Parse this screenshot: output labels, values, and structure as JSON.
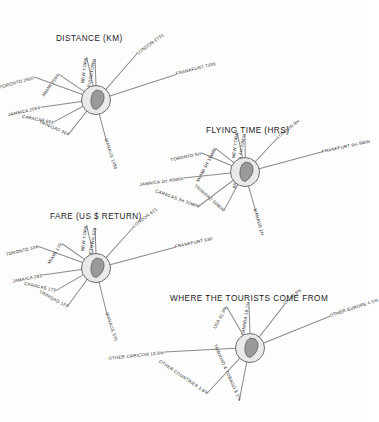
{
  "page": {
    "background": "#fdfdfd",
    "ink": "#1b1b1b",
    "hub_fill": "#e9e9e9",
    "hub_stroke": "#6d6d6d",
    "island_fill": "#9a9a9a",
    "spoke_stroke": "#8a8a8a"
  },
  "chart_data": [
    {
      "type": "radial-spoke",
      "id": "distance",
      "title": "DISTANCE (KM)",
      "unit": "KM",
      "hub_label": "BARBADOS",
      "categories": [
        "TORONTO",
        "MIAMI",
        "NEW YORK",
        "BRIDGETOWN",
        "LONDON",
        "FRANKFURT",
        "MANAUS",
        "TRINIDAD",
        "CARACAS",
        "JAMAICA"
      ],
      "spokes": [
        {
          "label": "TORONTO 3910",
          "place": "TORONTO",
          "value": 3910,
          "angle": 200,
          "length": 66,
          "text_angle": -16
        },
        {
          "label": "MIAMI 2594",
          "place": "MIAMI",
          "value": 2594,
          "angle": 214,
          "length": 46,
          "text_angle": -55
        },
        {
          "label": "NEW YORK",
          "place": "NEW YORK",
          "value": null,
          "angle": 257,
          "length": 44,
          "text_angle": -82
        },
        {
          "label": "BRIDGETOWN",
          "place": "BRIDGETOWN",
          "value": null,
          "angle": 268,
          "length": 41,
          "text_angle": -80
        },
        {
          "label": "LONDON 6731",
          "place": "LONDON",
          "value": 6731,
          "angle": 311,
          "length": 62,
          "text_angle": -36
        },
        {
          "label": "FRANKFURT 7336",
          "place": "FRANKFURT",
          "value": 7336,
          "angle": 342,
          "length": 84,
          "text_angle": -14
        },
        {
          "label": "MANAUS 1480",
          "place": "MANAUS",
          "value": 1480,
          "angle": 75,
          "length": 40,
          "text_angle": 72
        },
        {
          "label": "TRINIDAD 364",
          "place": "TRINIDAD",
          "value": 364,
          "angle": 128,
          "length": 44,
          "text_angle": 24
        },
        {
          "label": "CARACAS 801",
          "place": "CARACAS",
          "value": 801,
          "angle": 152,
          "length": 48,
          "text_angle": 11
        },
        {
          "label": "JAMAICA 2054",
          "place": "JAMAICA",
          "value": 2054,
          "angle": 172,
          "length": 56,
          "text_angle": -13
        }
      ]
    },
    {
      "type": "radial-spoke",
      "id": "flying-time",
      "title": "FLYING TIME (HRS)",
      "unit": "HRS",
      "hub_label": "BARBADOS",
      "categories": [
        "TORONTO",
        "MIAMI",
        "NEW YORK",
        "BRIDGETOWN",
        "LONDON",
        "FRANKFURT",
        "MANAUS",
        "TRINIDAD",
        "CARACAS",
        "JAMAICA"
      ],
      "spokes": [
        {
          "label": "TORONTO 5H",
          "place": "TORONTO",
          "value": "5H",
          "angle": 203,
          "length": 48,
          "text_angle": -12
        },
        {
          "label": "MIAMI 3H 35MIN",
          "place": "MIAMI",
          "value": "3H 35MIN",
          "angle": 218,
          "length": 38,
          "text_angle": -62
        },
        {
          "label": "NEW YORK",
          "place": "NEW YORK",
          "value": null,
          "angle": 258,
          "length": 40,
          "text_angle": -82
        },
        {
          "label": "BRIDGETOWN 4H 30MIN",
          "place": "BRIDGETOWN",
          "value": "4H 30MIN",
          "angle": 269,
          "length": 38,
          "text_angle": -80
        },
        {
          "label": "LONDON 8H",
          "place": "LONDON",
          "value": "8H",
          "angle": 313,
          "length": 47,
          "text_angle": -38
        },
        {
          "label": "FRANKFURT 9H 5MIN",
          "place": "FRANKFURT",
          "value": "9H 5MIN",
          "angle": 345,
          "length": 80,
          "text_angle": -12
        },
        {
          "label": "MANAUS 2H",
          "place": "MANAUS",
          "value": "2H",
          "angle": 74,
          "length": 38,
          "text_angle": 74
        },
        {
          "label": "TRINIDAD 50MIN",
          "place": "TRINIDAD",
          "value": "50MIN",
          "angle": 118,
          "length": 44,
          "text_angle": 41
        },
        {
          "label": "CARACAS 2H 30MIN",
          "place": "CARACAS",
          "value": "2H 30MIN",
          "angle": 143,
          "length": 58,
          "text_angle": 20
        },
        {
          "label": "JAMAICA 2H 45MIN",
          "place": "JAMAICA",
          "value": "2H 45MIN",
          "angle": 174,
          "length": 62,
          "text_angle": -8
        }
      ]
    },
    {
      "type": "radial-spoke",
      "id": "fare",
      "title": "FARE (US $ RETURN)",
      "unit": "US $ RETURN",
      "hub_label": "BARBADOS",
      "categories": [
        "TORONTO",
        "MIAMI",
        "NEW YORK",
        "BRIDGETOWN",
        "LONDON",
        "FRANKFURT",
        "MANAUS",
        "TRINIDAD",
        "CARACAS",
        "JAMAICA"
      ],
      "spokes": [
        {
          "label": "TORONTO 334",
          "place": "TORONTO",
          "value": 334,
          "angle": 200,
          "length": 62,
          "text_angle": -14
        },
        {
          "label": "MIAMI 179",
          "place": "MIAMI",
          "value": 179,
          "angle": 215,
          "length": 42,
          "text_angle": -58
        },
        {
          "label": "NEW YORK",
          "place": "NEW YORK",
          "value": null,
          "angle": 257,
          "length": 44,
          "text_angle": -82
        },
        {
          "label": "BRIDGETOWN 620",
          "place": "BRIDGETOWN",
          "value": 620,
          "angle": 268,
          "length": 40,
          "text_angle": -80
        },
        {
          "label": "LONDON 621",
          "place": "LONDON",
          "value": 621,
          "angle": 312,
          "length": 56,
          "text_angle": -37
        },
        {
          "label": "FRANKFURT 630",
          "place": "FRANKFURT",
          "value": 630,
          "angle": 345,
          "length": 82,
          "text_angle": -12
        },
        {
          "label": "MANAUS 370",
          "place": "MANAUS",
          "value": 370,
          "angle": 76,
          "length": 46,
          "text_angle": 72
        },
        {
          "label": "TRINIDAD 123",
          "place": "TRINIDAD",
          "value": 123,
          "angle": 126,
          "length": 48,
          "text_angle": 28
        },
        {
          "label": "CARACAS 173",
          "place": "CARACAS",
          "value": 173,
          "angle": 150,
          "length": 46,
          "text_angle": 13
        },
        {
          "label": "JAMAICA 283",
          "place": "JAMAICA",
          "value": 283,
          "angle": 172,
          "length": 54,
          "text_angle": -11
        }
      ]
    },
    {
      "type": "radial-spoke",
      "id": "tourists",
      "title": "WHERE THE TOURISTS COME FROM",
      "unit": "%",
      "hub_label": "BARBADOS",
      "categories": [
        "USA",
        "CANADA",
        "UK",
        "OTHER EUROPE",
        "OTHER CARICOM",
        "OTHER COUNTRIES",
        "TRINIDAD & TOBAGO"
      ],
      "values": [
        41.9,
        19.7,
        10.8,
        4.5,
        10.9,
        3.6,
        8.1
      ],
      "spokes": [
        {
          "label": "USA 41.9%",
          "place": "USA",
          "value": 41.9,
          "angle": 240,
          "length": 48,
          "text_angle": -62
        },
        {
          "label": "CANADA 19.7%",
          "place": "CANADA",
          "value": 19.7,
          "angle": 268,
          "length": 46,
          "text_angle": -81
        },
        {
          "label": "UK 10.8%",
          "place": "UK",
          "value": 10.8,
          "angle": 308,
          "length": 56,
          "text_angle": -40
        },
        {
          "label": "OTHER EUROPE 4.5%",
          "place": "OTHER EUROPE",
          "value": 4.5,
          "angle": 338,
          "length": 86,
          "text_angle": -18
        },
        {
          "label": "OTHER CARICOM 10.9%",
          "place": "OTHER CARICOM",
          "value": 10.9,
          "angle": 177,
          "length": 86,
          "text_angle": -6
        },
        {
          "label": "OTHER COUNTRIES 3.6%",
          "place": "OTHER COUNTRIES",
          "value": 3.6,
          "angle": 133,
          "length": 62,
          "text_angle": 34
        },
        {
          "label": "TRINIDAD & TOBAGO 8.1%",
          "place": "TRINIDAD & TOBAGO",
          "value": 8.1,
          "angle": 101,
          "length": 54,
          "text_angle": 66
        }
      ]
    }
  ]
}
